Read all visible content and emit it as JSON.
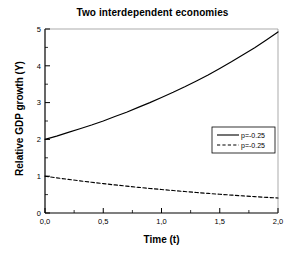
{
  "chart_data": {
    "type": "line",
    "title": "Two interdependent economies",
    "xlabel": "Time (t)",
    "ylabel": "Relative GDP growth (Y)",
    "xlim": [
      0,
      2
    ],
    "ylim": [
      0,
      5
    ],
    "grid": false,
    "legend_position": "center-right",
    "x_ticks": [
      "0,0",
      "0,5",
      "1,0",
      "1,5",
      "2,0"
    ],
    "x_tick_values": [
      0,
      0.5,
      1,
      1.5,
      2
    ],
    "y_ticks": [
      "0",
      "1",
      "2",
      "3",
      "4",
      "5"
    ],
    "y_tick_values": [
      0,
      1,
      2,
      3,
      4,
      5
    ],
    "x": [
      0,
      0.1,
      0.2,
      0.3,
      0.4,
      0.5,
      0.6,
      0.7,
      0.8,
      0.9,
      1.0,
      1.1,
      1.2,
      1.3,
      1.4,
      1.5,
      1.6,
      1.7,
      1.8,
      1.9,
      2.0
    ],
    "series": [
      {
        "name": "p=-0.25",
        "style": "solid",
        "color": "#000000",
        "values": [
          2.0,
          2.09,
          2.19,
          2.29,
          2.39,
          2.5,
          2.62,
          2.74,
          2.87,
          3.0,
          3.14,
          3.28,
          3.43,
          3.59,
          3.75,
          3.93,
          4.11,
          4.3,
          4.49,
          4.7,
          4.92
        ]
      },
      {
        "name": "p=-0.25",
        "style": "dashed",
        "color": "#000000",
        "values": [
          1.0,
          0.956,
          0.914,
          0.874,
          0.835,
          0.799,
          0.763,
          0.73,
          0.698,
          0.667,
          0.638,
          0.61,
          0.583,
          0.557,
          0.532,
          0.509,
          0.487,
          0.465,
          0.445,
          0.425,
          0.407
        ]
      }
    ]
  },
  "legend": {
    "entries": [
      {
        "label": "p=-0.25",
        "style": "solid"
      },
      {
        "label": "p=-0.25",
        "style": "dashed"
      }
    ]
  }
}
